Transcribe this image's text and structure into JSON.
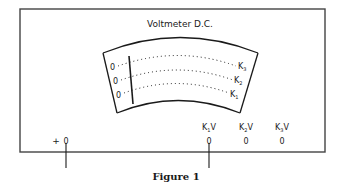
{
  "figure": {
    "title": "Voltmeter D.C.",
    "caption": "Figure 1",
    "scale_rows": [
      {
        "zero_label": "0",
        "end_label": "K",
        "end_sub": "3"
      },
      {
        "zero_label": "0",
        "end_label": "K",
        "end_sub": "2"
      },
      {
        "zero_label": "0",
        "end_label": "K",
        "end_sub": "1"
      }
    ],
    "terminals": {
      "positive": {
        "sign": "+",
        "label": "0"
      },
      "ranges": [
        {
          "label": "K",
          "sub": "1",
          "unit": "V",
          "terminal": "0"
        },
        {
          "label": "K",
          "sub": "2",
          "unit": "V",
          "terminal": "0"
        },
        {
          "label": "K",
          "sub": "3",
          "unit": "V",
          "terminal": "0"
        }
      ]
    },
    "colors": {
      "ink": "#1a1a1a",
      "box": "#444444",
      "background": "#ffffff"
    }
  }
}
